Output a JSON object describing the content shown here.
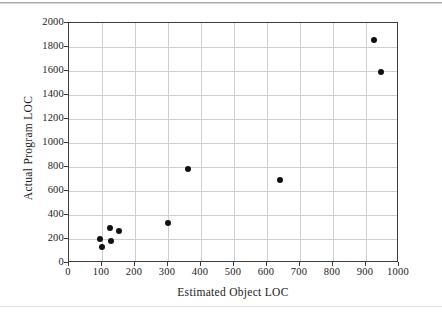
{
  "figure": {
    "xlabel": "Estimated Object LOC",
    "ylabel": "Actual Program LOC"
  },
  "chart_data": {
    "type": "scatter",
    "title": "",
    "xlabel": "Estimated Object LOC",
    "ylabel": "Actual Program LOC",
    "xlim": [
      0,
      1000
    ],
    "ylim": [
      0,
      2000
    ],
    "xticks": [
      0,
      100,
      200,
      300,
      400,
      500,
      600,
      700,
      800,
      900,
      1000
    ],
    "yticks": [
      0,
      200,
      400,
      600,
      800,
      1000,
      1200,
      1400,
      1600,
      1800,
      2000
    ],
    "xtick_labels": [
      "0",
      "100",
      "200",
      "300",
      "400",
      "500",
      "600",
      "700",
      "800",
      "900",
      "1000"
    ],
    "ytick_labels": [
      "0",
      "200",
      "400",
      "600",
      "800",
      "1000",
      "1200",
      "1400",
      "1600",
      "1800",
      "2000"
    ],
    "grid": true,
    "legend": false,
    "marker": {
      "shape": "circle",
      "color": "#111111",
      "size": 6
    },
    "points": [
      {
        "x": 95,
        "y": 200
      },
      {
        "x": 100,
        "y": 135
      },
      {
        "x": 125,
        "y": 290
      },
      {
        "x": 128,
        "y": 185
      },
      {
        "x": 150,
        "y": 265
      },
      {
        "x": 300,
        "y": 330
      },
      {
        "x": 360,
        "y": 780
      },
      {
        "x": 640,
        "y": 690
      },
      {
        "x": 925,
        "y": 1860
      },
      {
        "x": 945,
        "y": 1595
      }
    ]
  }
}
